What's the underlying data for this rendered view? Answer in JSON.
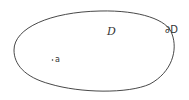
{
  "diagram": {
    "region_label": "D",
    "boundary_label": "∂D",
    "point_label": "a",
    "colors": {
      "stroke": "#333333",
      "background": "#ffffff"
    }
  }
}
